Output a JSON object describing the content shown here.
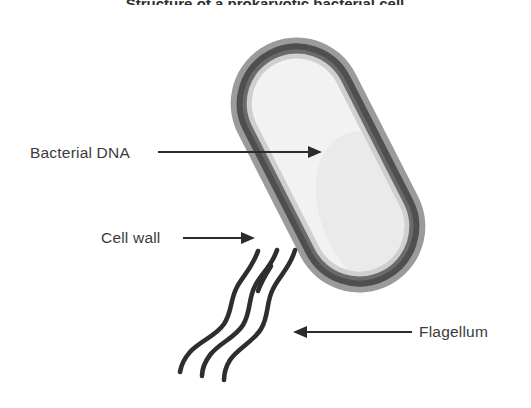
{
  "figure": {
    "title": "Structure of a prokaryotic bacterial cell",
    "title_visible_note": "cropped at top edge",
    "background_color": "#ffffff",
    "width": 531,
    "height": 408
  },
  "labels": [
    {
      "id": "bacterial-dna",
      "text": "Bacterial DNA",
      "text_x": 30,
      "text_y": 158,
      "leader_from_x": 158,
      "leader_from_y": 152,
      "leader_to_x": 318,
      "leader_to_y": 152,
      "arrow_direction": "right",
      "color": "#3c3c3c"
    },
    {
      "id": "cell-wall",
      "text": "Cell wall",
      "text_x": 101,
      "text_y": 243,
      "leader_from_x": 183,
      "leader_from_y": 238,
      "leader_to_x": 251,
      "leader_to_y": 238,
      "arrow_direction": "right",
      "color": "#3c3c3c"
    },
    {
      "id": "flagellum",
      "text": "Flagellum",
      "text_x": 419,
      "text_y": 337,
      "leader_from_x": 410,
      "leader_from_y": 332,
      "leader_to_x": 294,
      "leader_to_y": 332,
      "arrow_direction": "left",
      "color": "#3c3c3c"
    }
  ],
  "cell": {
    "name": "bacterial-cell",
    "shape": "rod / capsule (bacillus)",
    "rotation_degrees": -27,
    "center_x": 328,
    "center_y": 165,
    "capsule_width": 132,
    "capsule_height": 270,
    "layers": [
      {
        "name": "capsule-outer-layer",
        "color": "#9b9b9b",
        "role": "outer capsule / slime layer"
      },
      {
        "name": "cell-wall-layer",
        "color": "#5d5d5d",
        "role": "cell wall (dark outline)"
      },
      {
        "name": "plasma-membrane-layer",
        "color": "#cfcfcf",
        "role": "plasma membrane"
      },
      {
        "name": "cytoplasm",
        "color": "#f2f2f2",
        "role": "cytoplasm interior"
      }
    ]
  },
  "ribosomes": {
    "name": "ribosome-dots",
    "color": "#c2c2c2",
    "radius": 3.1,
    "count": 34,
    "points": [
      [
        312,
        53
      ],
      [
        349,
        58
      ],
      [
        381,
        70
      ],
      [
        291,
        78
      ],
      [
        327,
        84
      ],
      [
        361,
        92
      ],
      [
        392,
        104
      ],
      [
        272,
        104
      ],
      [
        306,
        112
      ],
      [
        341,
        122
      ],
      [
        376,
        130
      ],
      [
        404,
        140
      ],
      [
        258,
        133
      ],
      [
        289,
        144
      ],
      [
        322,
        152
      ],
      [
        357,
        162
      ],
      [
        390,
        170
      ],
      [
        418,
        178
      ],
      [
        246,
        162
      ],
      [
        277,
        174
      ],
      [
        309,
        184
      ],
      [
        343,
        192
      ],
      [
        377,
        200
      ],
      [
        404,
        209
      ],
      [
        237,
        192
      ],
      [
        268,
        204
      ],
      [
        300,
        214
      ],
      [
        333,
        222
      ],
      [
        366,
        230
      ],
      [
        392,
        238
      ],
      [
        258,
        232
      ],
      [
        288,
        242
      ],
      [
        320,
        250
      ],
      [
        352,
        256
      ]
    ]
  },
  "dna": {
    "name": "bacterial-dna-strand",
    "color": "#5f5f5f",
    "stroke_width": 2.0,
    "description": "single circular tangled nucleoid strand"
  },
  "flagella": {
    "name": "flagella-bundle",
    "color": "#2e2e2e",
    "stroke_width": 4.6,
    "count": 3
  }
}
